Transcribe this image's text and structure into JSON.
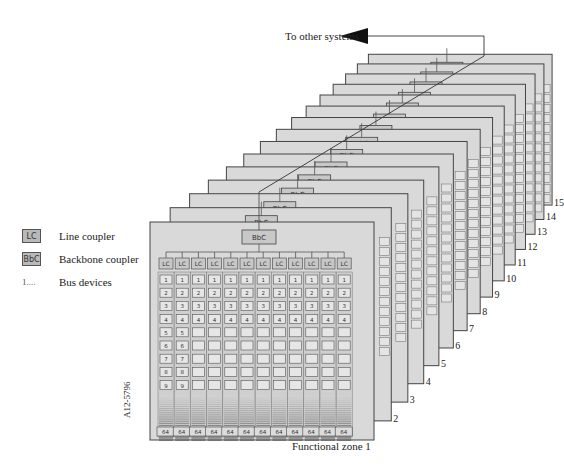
{
  "figure": {
    "top_label": "To other systems",
    "figure_id": "A12-5796",
    "front_zone_label": "Functional zone 1",
    "backbone_coupler_label": "BbC",
    "line_coupler_label": "LC",
    "line_end_label": "64",
    "device_numbers_visible": [
      "1",
      "2",
      "3",
      "4",
      "5",
      "6",
      "7",
      "8",
      "9",
      "10",
      "11"
    ],
    "lines_per_zone": 12
  },
  "legend": {
    "items": [
      {
        "symbol": "LC",
        "label": "Line coupler"
      },
      {
        "symbol": "BbC",
        "label": "Backbone coupler"
      },
      {
        "symbol": "1....",
        "label": "Bus devices"
      }
    ]
  },
  "zones": {
    "numbers": [
      "2",
      "3",
      "4",
      "5",
      "6",
      "7",
      "8",
      "9",
      "10",
      "11",
      "12",
      "13",
      "14",
      "15"
    ]
  },
  "colors": {
    "panel_fill": "#d9d9d9",
    "panel_border": "#444444",
    "box_fill": "#c8c8c8",
    "arrow": "#111111"
  }
}
